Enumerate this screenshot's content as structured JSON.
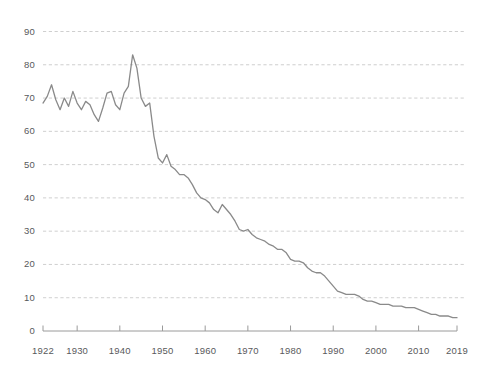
{
  "chart_data": {
    "type": "line",
    "title": "",
    "subtitle": "",
    "xlabel": "",
    "ylabel": "",
    "xlim": [
      1922,
      2019
    ],
    "ylim": [
      0,
      90
    ],
    "grid": true,
    "legend": null,
    "legend_position": "none",
    "series_color": "#8a8a8a",
    "axis_color": "#9a9a9a",
    "grid_color": "#c9c9c9",
    "text_color": "#58595b",
    "background": "#ffffff",
    "x_ticks": [
      1922,
      1930,
      1940,
      1950,
      1960,
      1970,
      1980,
      1990,
      2000,
      2010,
      2019
    ],
    "x_tick_labels": [
      "1922",
      "1930",
      "1940",
      "1950",
      "1960",
      "1970",
      "1980",
      "1990",
      "2000",
      "2010",
      "2019"
    ],
    "y_ticks": [
      0,
      10,
      20,
      30,
      40,
      50,
      60,
      70,
      80,
      90
    ],
    "y_tick_labels": [
      "0",
      "10",
      "20",
      "30",
      "40",
      "50",
      "60",
      "70",
      "80",
      "90"
    ],
    "series": [
      {
        "name": "series-1",
        "x": [
          1922,
          1923,
          1924,
          1925,
          1926,
          1927,
          1928,
          1929,
          1930,
          1931,
          1932,
          1933,
          1934,
          1935,
          1936,
          1937,
          1938,
          1939,
          1940,
          1941,
          1942,
          1943,
          1944,
          1945,
          1946,
          1947,
          1948,
          1949,
          1950,
          1951,
          1952,
          1953,
          1954,
          1955,
          1956,
          1957,
          1958,
          1959,
          1960,
          1961,
          1962,
          1963,
          1964,
          1965,
          1966,
          1967,
          1968,
          1969,
          1970,
          1971,
          1972,
          1973,
          1974,
          1975,
          1976,
          1977,
          1978,
          1979,
          1980,
          1981,
          1982,
          1983,
          1984,
          1985,
          1986,
          1987,
          1988,
          1989,
          1990,
          1991,
          1992,
          1993,
          1994,
          1995,
          1996,
          1997,
          1998,
          1999,
          2000,
          2001,
          2002,
          2003,
          2004,
          2005,
          2006,
          2007,
          2008,
          2009,
          2010,
          2011,
          2012,
          2013,
          2014,
          2015,
          2016,
          2017,
          2018,
          2019
        ],
        "values": [
          68.5,
          70.5,
          74.0,
          69.5,
          66.5,
          70.0,
          67.5,
          72.0,
          68.5,
          66.5,
          69.0,
          68.0,
          65.0,
          63.0,
          67.0,
          71.5,
          72.0,
          68.0,
          66.5,
          71.5,
          73.5,
          83.0,
          79.0,
          70.0,
          67.5,
          68.5,
          58.5,
          52.0,
          50.5,
          53.0,
          49.5,
          48.5,
          47.0,
          47.0,
          46.0,
          44.0,
          41.5,
          40.0,
          39.5,
          38.5,
          36.5,
          35.5,
          38.0,
          36.5,
          35.0,
          33.0,
          30.5,
          30.0,
          30.5,
          29.0,
          28.0,
          27.5,
          27.0,
          26.0,
          25.5,
          24.5,
          24.5,
          23.5,
          21.5,
          21.0,
          21.0,
          20.5,
          19.0,
          18.0,
          17.5,
          17.5,
          16.5,
          15.0,
          13.5,
          12.0,
          11.5,
          11.0,
          11.0,
          11.0,
          10.5,
          9.5,
          9.0,
          9.0,
          8.5,
          8.0,
          8.0,
          8.0,
          7.5,
          7.5,
          7.5,
          7.0,
          7.0,
          7.0,
          6.5,
          6.0,
          5.5,
          5.0,
          5.0,
          4.5,
          4.5,
          4.5,
          4.0,
          4.0
        ]
      }
    ]
  },
  "axis": {
    "y_axis_name": "y-axis",
    "x_axis_name": "x-axis"
  }
}
